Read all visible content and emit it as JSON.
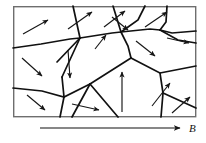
{
  "figure": {
    "name": "magnetic-domain-grain-diagram",
    "frame": {
      "x": 13,
      "y": 6,
      "width": 183,
      "height": 111
    },
    "colors": {
      "background": "#ffffff",
      "frame_stroke": "#6e6e6e",
      "boundary_stroke": "#111111",
      "arrow_stroke": "#161616"
    },
    "grain_boundaries": [
      {
        "id": "gb-1",
        "points": "13,48 41,44 70,39 80,38"
      },
      {
        "id": "gb-2",
        "points": "80,38 112,33 121,32"
      },
      {
        "id": "gb-3",
        "points": "121,32 150,29 160,30"
      },
      {
        "id": "gb-4",
        "points": "160,30 178,40 196,43"
      },
      {
        "id": "gb-5",
        "points": "80,38 73,6"
      },
      {
        "id": "gb-6",
        "points": "80,38 62,77"
      },
      {
        "id": "gb-7",
        "points": "80,38 57,62"
      },
      {
        "id": "gb-8",
        "points": "121,32 113,6"
      },
      {
        "id": "gb-9",
        "points": "121,32 138,20 145,6"
      },
      {
        "id": "gb-10",
        "points": "121,32 128,46 131,58"
      },
      {
        "id": "gb-11",
        "points": "160,30 166,22 167,6"
      },
      {
        "id": "gb-12",
        "points": "160,30 172,33 196,31"
      },
      {
        "id": "gb-13",
        "points": "131,58 90,84"
      },
      {
        "id": "gb-14",
        "points": "90,84 72,117"
      },
      {
        "id": "gb-15",
        "points": "90,84 64,97 42,91 13,88"
      },
      {
        "id": "gb-16",
        "points": "62,77 64,97"
      },
      {
        "id": "gb-17",
        "points": "64,97 60,117"
      },
      {
        "id": "gb-18",
        "points": "131,58 160,73 163,93 161,117"
      },
      {
        "id": "gb-19",
        "points": "160,73 196,66"
      },
      {
        "id": "gb-20",
        "points": "163,93 196,108"
      },
      {
        "id": "gb-21",
        "points": "90,84 118,117"
      }
    ],
    "domain_arrows": [
      {
        "id": "arrow-1",
        "x1": 23,
        "y1": 34,
        "x2": 48,
        "y2": 20,
        "direction": "up-right"
      },
      {
        "id": "arrow-2",
        "x1": 68,
        "y1": 29,
        "x2": 92,
        "y2": 12,
        "direction": "up-right"
      },
      {
        "id": "arrow-3",
        "x1": 104,
        "y1": 27,
        "x2": 125,
        "y2": 11,
        "direction": "up-right"
      },
      {
        "id": "arrow-4",
        "x1": 145,
        "y1": 27,
        "x2": 167,
        "y2": 12,
        "direction": "up-right"
      },
      {
        "id": "arrow-5",
        "x1": 112,
        "y1": 17,
        "x2": 128,
        "y2": 30,
        "direction": "down-right"
      },
      {
        "id": "arrow-6",
        "x1": 167,
        "y1": 38,
        "x2": 189,
        "y2": 43,
        "direction": "right"
      },
      {
        "id": "arrow-7",
        "x1": 136,
        "y1": 41,
        "x2": 155,
        "y2": 56,
        "direction": "down-right"
      },
      {
        "id": "arrow-8",
        "x1": 22,
        "y1": 58,
        "x2": 42,
        "y2": 76,
        "direction": "down-right"
      },
      {
        "id": "arrow-9",
        "x1": 68,
        "y1": 50,
        "x2": 70,
        "y2": 78,
        "direction": "down"
      },
      {
        "id": "arrow-10",
        "x1": 95,
        "y1": 49,
        "x2": 106,
        "y2": 35,
        "direction": "up-right"
      },
      {
        "id": "arrow-11",
        "x1": 122,
        "y1": 112,
        "x2": 122,
        "y2": 72,
        "direction": "up"
      },
      {
        "id": "arrow-12",
        "x1": 27,
        "y1": 95,
        "x2": 45,
        "y2": 110,
        "direction": "down-right"
      },
      {
        "id": "arrow-13",
        "x1": 72,
        "y1": 104,
        "x2": 99,
        "y2": 110,
        "direction": "right"
      },
      {
        "id": "arrow-14",
        "x1": 152,
        "y1": 106,
        "x2": 170,
        "y2": 83,
        "direction": "up-right"
      },
      {
        "id": "arrow-15",
        "x1": 172,
        "y1": 113,
        "x2": 190,
        "y2": 97,
        "direction": "up-right"
      }
    ],
    "field_indicator": {
      "label": "B",
      "line": {
        "x1": 40,
        "y1": 128,
        "x2": 180,
        "y2": 128
      },
      "label_position": {
        "x": 189,
        "y": 132
      },
      "direction": "right"
    }
  }
}
